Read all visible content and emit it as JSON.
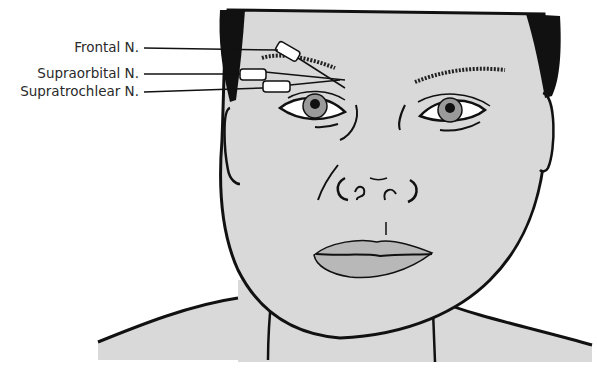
{
  "figure": {
    "type": "anatomical illustration",
    "colors": {
      "skin": "#d9d9d9",
      "outline": "#111111",
      "hair": "#111111",
      "iris": "#9a9a9a",
      "lips": "#b8b8b8",
      "background": "#ffffff"
    }
  },
  "labels": [
    {
      "id": "frontal",
      "text": "Frontal N."
    },
    {
      "id": "supraorbital",
      "text": "Supraorbital N."
    },
    {
      "id": "supratrochlear",
      "text": "Supratrochlear N."
    }
  ]
}
